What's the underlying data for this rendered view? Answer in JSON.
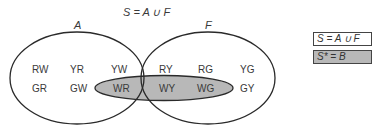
{
  "title": "S = A ∪ F",
  "sets": {
    "A": {
      "label": "A"
    },
    "F": {
      "label": "F"
    },
    "B": {
      "label": "B",
      "fill": "#b8b8b8"
    }
  },
  "elements": {
    "a_only_row1": [
      "RW",
      "YR",
      "YW"
    ],
    "a_only_row2": [
      "GR",
      "GW"
    ],
    "a_and_b": [
      "WR"
    ],
    "intersection_row1": [
      "RY"
    ],
    "intersection_b": [
      "WY"
    ],
    "f_only_row1": [
      "RG",
      "YG"
    ],
    "f_and_b": [
      "WG"
    ],
    "f_only_row2": [
      "GY"
    ]
  },
  "legend": [
    {
      "text": "S = A ∪ F",
      "fill": "#ffffff"
    },
    {
      "text": "S* = B",
      "fill": "#b8b8b8"
    }
  ],
  "colors": {
    "stroke": "#2a2a2a",
    "shade": "#b8b8b8",
    "text": "#3a3a3a"
  }
}
